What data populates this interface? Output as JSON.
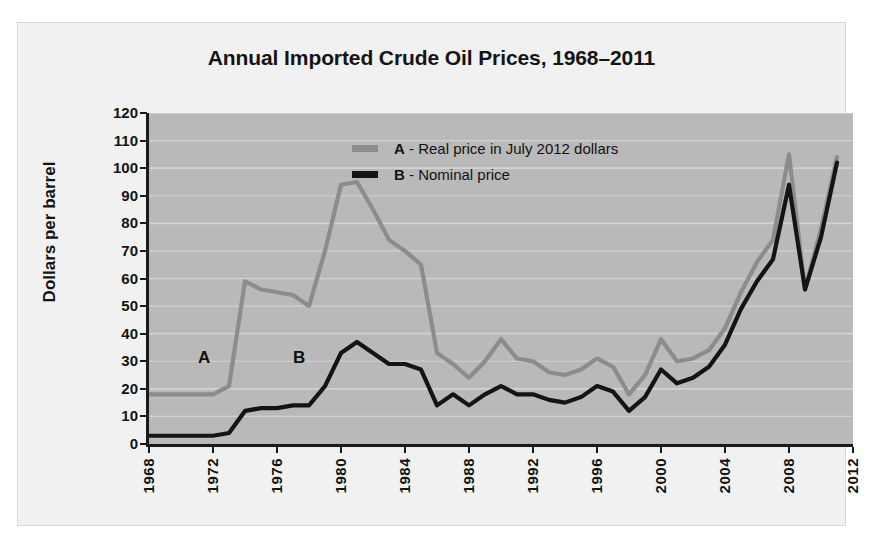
{
  "figure": {
    "title": "Annual Imported Crude Oil Prices, 1968–2011",
    "ylabel": "Dollars per barrel",
    "source": "SOURCE: ENERGY INFORMATION ADMINISTRATION SHORT-TERM ENERGY OUTLOOK, AUG. 2011",
    "annotation_a": "A",
    "annotation_b": "B",
    "colors": {
      "series_a": "#8c8c8c",
      "series_b": "#141414",
      "plot_background": "#b9b9b9",
      "panel_background": "#f1f1f1",
      "gridline": "#d2d2d2",
      "axis": "#1a1a1a"
    }
  },
  "legend": {
    "position": "inside-top-center",
    "entries": [
      {
        "key": "A",
        "separator": " - ",
        "label": "Real price in July 2012 dollars",
        "color": "#8c8c8c"
      },
      {
        "key": "B",
        "separator": " - ",
        "label": "Nominal price",
        "color": "#141414"
      }
    ]
  },
  "chart_data": {
    "type": "line",
    "title": "Annual Imported Crude Oil Prices, 1968–2011",
    "xlabel": "",
    "ylabel": "Dollars per barrel",
    "xlim": [
      1968,
      2012
    ],
    "ylim": [
      0,
      120
    ],
    "grid": true,
    "ytick_labels": [
      "0",
      "10",
      "20",
      "30",
      "40",
      "50",
      "60",
      "70",
      "80",
      "90",
      "100",
      "110",
      "120"
    ],
    "ytick_values": [
      0,
      10,
      20,
      30,
      40,
      50,
      60,
      70,
      80,
      90,
      100,
      110,
      120
    ],
    "xtick_labels": [
      "1968",
      "1972",
      "1976",
      "1980",
      "1984",
      "1988",
      "1992",
      "1996",
      "2000",
      "2004",
      "2008",
      "2012"
    ],
    "xtick_values": [
      1968,
      1972,
      1976,
      1980,
      1984,
      1988,
      1992,
      1996,
      2000,
      2004,
      2008,
      2012
    ],
    "x": [
      1968,
      1969,
      1970,
      1971,
      1972,
      1973,
      1974,
      1975,
      1976,
      1977,
      1978,
      1979,
      1980,
      1981,
      1982,
      1983,
      1984,
      1985,
      1986,
      1987,
      1988,
      1989,
      1990,
      1991,
      1992,
      1993,
      1994,
      1995,
      1996,
      1997,
      1998,
      1999,
      2000,
      2001,
      2002,
      2003,
      2004,
      2005,
      2006,
      2007,
      2008,
      2009,
      2010,
      2011
    ],
    "series": [
      {
        "name": "A - Real price in July 2012 dollars",
        "color": "#8c8c8c",
        "values": [
          18,
          18,
          18,
          18,
          18,
          21,
          59,
          56,
          55,
          54,
          50,
          70,
          94,
          95,
          85,
          74,
          70,
          65,
          33,
          29,
          24,
          30,
          38,
          31,
          30,
          26,
          25,
          27,
          31,
          28,
          18,
          25,
          38,
          30,
          31,
          34,
          42,
          55,
          66,
          74,
          105,
          56,
          78,
          104
        ]
      },
      {
        "name": "B - Nominal price",
        "color": "#141414",
        "values": [
          3,
          3,
          3,
          3,
          3,
          4,
          12,
          13,
          13,
          14,
          14,
          21,
          33,
          37,
          33,
          29,
          29,
          27,
          14,
          18,
          14,
          18,
          21,
          18,
          18,
          16,
          15,
          17,
          21,
          19,
          12,
          17,
          27,
          22,
          24,
          28,
          36,
          49,
          59,
          67,
          94,
          56,
          75,
          102
        ]
      }
    ]
  }
}
